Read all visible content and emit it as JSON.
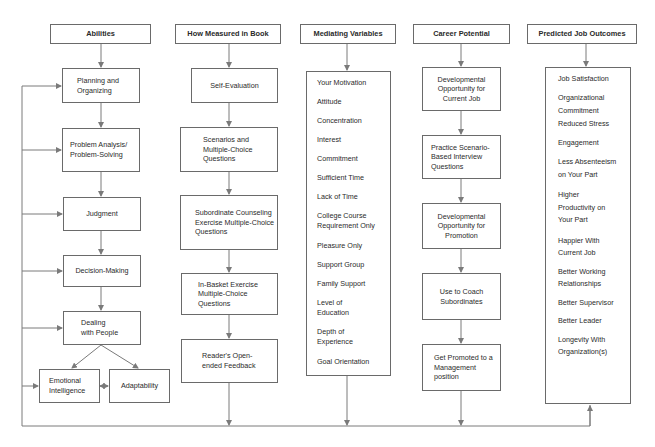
{
  "headers": {
    "abilities": "Abilities",
    "measured": "How Measured in Book",
    "mediating": "Mediating Variables",
    "career": "Career Potential",
    "outcomes": "Predicted Job Outcomes"
  },
  "abilities": [
    "Planning and Organizing",
    "Problem Analysis/ Problem-Solving",
    "Judgment",
    "Decision-Making",
    "Dealing with People",
    "Emotional Intelligence",
    "Adaptability"
  ],
  "measured": [
    "Self-Evaluation",
    "Scenarios and Multiple-Choice Questions",
    "Subordinate Counseling Exercise Multiple-Choice Questions",
    "In-Basket Exercise Multiple-Choice Questions",
    "Reader's Open-ended Feedback"
  ],
  "mediating": [
    "Your Motivation",
    "Attitude",
    "Concentration",
    "Interest",
    "Commitment",
    "Sufficient Time",
    "Lack of Time",
    "College Course Requirement Only",
    "Pleasure Only",
    "Support Group",
    "Family Support",
    "Level of Education",
    "Depth of Experience",
    "Goal Orientation"
  ],
  "career": [
    "Developmental Opportunity for Current Job",
    "Practice Scenario-Based Interview Questions",
    "Developmental Opportunity for Promotion",
    "Use to Coach Subordinates",
    "Get Promoted to a Management position"
  ],
  "outcomes": [
    "Job Satisfaction",
    "Organizational Commitment",
    "Reduced Stress",
    "Engagement",
    "Less Absenteeism on Your Part",
    "Higher Productivity on Your Part",
    "Happier With Current Job",
    "Better Working Relationships",
    "Better Supervisor",
    "Better Leader",
    "Longevity With Organization(s)"
  ],
  "colors": {
    "line": "#7a7a7a",
    "border": "#6a6a6a",
    "text": "#2a2a2a"
  }
}
